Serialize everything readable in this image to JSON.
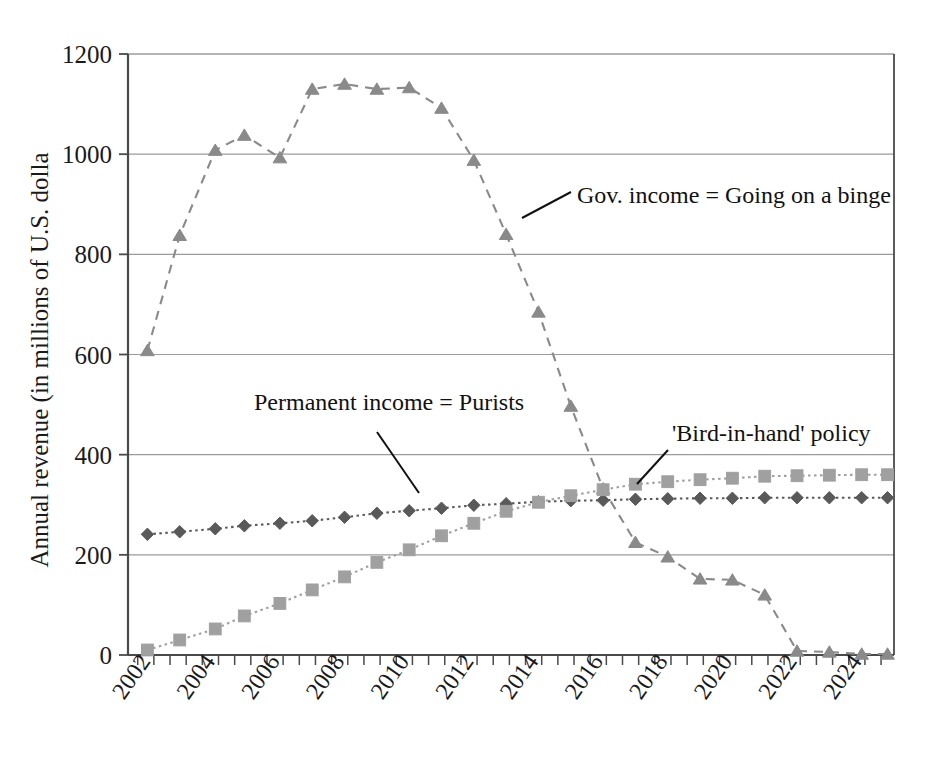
{
  "chart_data": {
    "type": "line",
    "title": "",
    "xlabel": "",
    "ylabel": "Annual revenue (in millions of U.S. dolla",
    "ylim": [
      0,
      1200
    ],
    "yticks": [
      0,
      200,
      400,
      600,
      800,
      1000,
      1200
    ],
    "ytick_labels": [
      "0",
      "200",
      "400",
      "600",
      "800",
      "1000",
      "1200"
    ],
    "grid": true,
    "legend_position": "inline-annotations",
    "x": [
      2002,
      2002.5,
      2003,
      2003.5,
      2004,
      2004.5,
      2005,
      2005.5,
      2006,
      2006.5,
      2007,
      2007.5,
      2008,
      2008.5,
      2009,
      2009.5,
      2010,
      2010.5,
      2011,
      2011.5,
      2012,
      2012.5,
      2013,
      2013.5,
      2014,
      2014.5,
      2015,
      2015.5,
      2016,
      2016.5,
      2017,
      2017.5,
      2018,
      2018.5,
      2019,
      2019.5,
      2020,
      2020.5,
      2021,
      2021.5,
      2022,
      2022.5,
      2023,
      2023.5,
      2024,
      2024.5,
      2025
    ],
    "xtick_labels": [
      "2002",
      "2004",
      "2006",
      "2008",
      "2010",
      "2012",
      "2014",
      "2016",
      "2018",
      "2020",
      "2022",
      "2024"
    ],
    "xtick_values": [
      2002,
      2004,
      2006,
      2008,
      2010,
      2012,
      2014,
      2016,
      2018,
      2020,
      2022,
      2024
    ],
    "xlim": [
      2001.7,
      2025.4
    ],
    "series": [
      {
        "name": "Gov. income = Going on a binge",
        "marker": "triangle",
        "line_style": "dashed",
        "color": "#8a8a8a",
        "x": [
          2002.3,
          2003.3,
          2004.4,
          2005.3,
          2006.4,
          2007.4,
          2008.4,
          2009.4,
          2010.4,
          2011.4,
          2012.4,
          2013.4,
          2014.4,
          2015.4,
          2016.4,
          2017.4,
          2018.4,
          2019.4,
          2020.4,
          2021.4,
          2022.4,
          2023.4,
          2024.4,
          2025.2
        ],
        "values": [
          608,
          838,
          1008,
          1038,
          993,
          1130,
          1140,
          1130,
          1133,
          1092,
          988,
          840,
          685,
          497,
          332,
          225,
          196,
          152,
          150,
          120,
          8,
          6,
          2,
          2
        ]
      },
      {
        "name": "Permanent income = Purists",
        "marker": "diamond",
        "line_style": "dotted",
        "color": "#595959",
        "x": [
          2002.3,
          2003.3,
          2004.4,
          2005.3,
          2006.4,
          2007.4,
          2008.4,
          2009.4,
          2010.4,
          2011.4,
          2012.4,
          2013.4,
          2014.4,
          2015.4,
          2016.4,
          2017.4,
          2018.4,
          2019.4,
          2020.4,
          2021.4,
          2022.4,
          2023.4,
          2024.4,
          2025.2
        ],
        "values": [
          241,
          246,
          252,
          258,
          263,
          268,
          275,
          283,
          288,
          293,
          299,
          302,
          306,
          308,
          309,
          311,
          312,
          313,
          313,
          314,
          314,
          314,
          314,
          314
        ]
      },
      {
        "name": "'Bird-in-hand' policy",
        "marker": "square",
        "line_style": "dotted",
        "color": "#a0a0a0",
        "x": [
          2002.3,
          2003.3,
          2004.4,
          2005.3,
          2006.4,
          2007.4,
          2008.4,
          2009.4,
          2010.4,
          2011.4,
          2012.4,
          2013.4,
          2014.4,
          2015.4,
          2016.4,
          2017.4,
          2018.4,
          2019.4,
          2020.4,
          2021.4,
          2022.4,
          2023.4,
          2024.4,
          2025.2
        ],
        "values": [
          10,
          30,
          52,
          78,
          103,
          130,
          156,
          185,
          210,
          238,
          263,
          287,
          305,
          318,
          330,
          341,
          346,
          350,
          353,
          357,
          358,
          359,
          360,
          360
        ]
      }
    ],
    "annotations": [
      {
        "id": "gov-income-annotation",
        "text": "Gov. income = Going on a binge",
        "text_x": 577,
        "text_y": 203,
        "leader_x1": 522,
        "leader_y1": 218,
        "leader_x2": 571,
        "leader_y2": 192
      },
      {
        "id": "permanent-income-annotation",
        "text": "Permanent income = Purists",
        "text_x": 254,
        "text_y": 410,
        "leader_x1": 377,
        "leader_y1": 432,
        "leader_x2": 419,
        "leader_y2": 493
      },
      {
        "id": "bird-in-hand-annotation",
        "text": "'Bird-in-hand' policy",
        "text_x": 672,
        "text_y": 441,
        "leader_x1": 637,
        "leader_y1": 484,
        "leader_x2": 668,
        "leader_y2": 450
      }
    ],
    "colors": {
      "axis": "#4a4a4a",
      "grid": "#9b9b9b",
      "gov_income": "#8a8a8a",
      "permanent_income": "#595959",
      "bird_in_hand": "#a0a0a0",
      "text": "#1a1a1a",
      "background": "#ffffff"
    }
  }
}
